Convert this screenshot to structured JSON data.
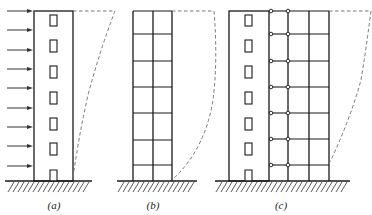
{
  "figure": {
    "type": "structural-deformation-comparison",
    "panels": [
      {
        "id": "a",
        "label": "(a)",
        "structure": "shear-wall",
        "deformation": "bending-type (flexural)",
        "lateral_load_arrows": 9,
        "windows": 6,
        "has_door": true
      },
      {
        "id": "b",
        "label": "(b)",
        "structure": "frame",
        "bays": 2,
        "stories": 7,
        "deformation": "shear-type"
      },
      {
        "id": "c",
        "label": "(c)",
        "structure": "frame-shear-wall (linked by hinged links)",
        "wall_windows": 6,
        "has_door": true,
        "link_levels": 7,
        "frame_bays": 2,
        "deformation": "bending-shear (S-shaped)"
      }
    ],
    "colors": {
      "line": "#1a1a1a",
      "dashed_deflection": "#777777",
      "background": "#ffffff"
    }
  }
}
